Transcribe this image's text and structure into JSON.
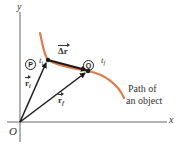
{
  "diagram": {
    "axes": {
      "x_label": "x",
      "y_label": "y",
      "origin_label": "O"
    },
    "points": [
      {
        "id": "P",
        "symbol": "P",
        "time_label": "t",
        "time_sub": "i"
      },
      {
        "id": "Q",
        "symbol": "Q",
        "time_label": "t",
        "time_sub": "f"
      }
    ],
    "vectors": [
      {
        "name": "r",
        "sub": "i",
        "from": "O",
        "to": "P"
      },
      {
        "name": "r",
        "sub": "f",
        "from": "O",
        "to": "Q"
      },
      {
        "name": "Δr",
        "sub": "",
        "from": "P",
        "to": "Q"
      }
    ],
    "path_label_line1": "Path of",
    "path_label_line2": "an object",
    "colors": {
      "path": "#e07a4a",
      "vector": "#1a1a1a",
      "axis": "#555555",
      "text": "#333333"
    }
  }
}
